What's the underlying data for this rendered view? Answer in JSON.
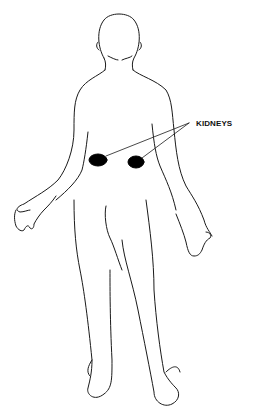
{
  "diagram": {
    "label": "KIDNEYS",
    "colors": {
      "outline": "#1a1a1a",
      "kidney_fill": "#000000",
      "background": "#ffffff"
    },
    "organs": [
      {
        "name": "left-kidney",
        "cx": 98,
        "cy": 160
      },
      {
        "name": "right-kidney",
        "cx": 136,
        "cy": 162
      }
    ]
  }
}
